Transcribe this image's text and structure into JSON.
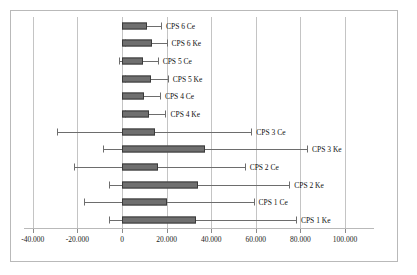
{
  "chart_data": {
    "type": "bar",
    "orientation": "horizontal",
    "title": "",
    "xlabel": "",
    "ylabel": "",
    "xlim": [
      -50,
      110
    ],
    "grid": true,
    "legend": false,
    "xticks": [
      -40,
      -20,
      0,
      20,
      40,
      60,
      80,
      100
    ],
    "xticklabels": [
      "-40.000",
      "-20.000",
      "0",
      "20.000",
      "40.000",
      "60.000",
      "80.000",
      "100.000"
    ],
    "categories": [
      "CPS 6 Ce",
      "CPS 6 Ke",
      "CPS 5 Ce",
      "CPS 5 Ke",
      "CPS 4 Ce",
      "CPS 4 Ke",
      "CPS 3 Ce",
      "CPS 3 Ke",
      "CPS 2 Ce",
      "CPS 2 Ke",
      "CPS 1 Ce",
      "CPS 1 Ke"
    ],
    "values": [
      11,
      13.5,
      9.5,
      13,
      10,
      12,
      15,
      37,
      16,
      34,
      20,
      33
    ],
    "error_low": [
      0,
      1.5,
      -1.5,
      1.5,
      0,
      1.5,
      -29,
      -8.5,
      -21.5,
      -6,
      -17,
      -6
    ],
    "error_high": [
      17.5,
      20,
      16,
      20.5,
      17,
      19.5,
      58,
      83,
      55,
      75,
      59,
      78
    ],
    "bar_color": "#6f6f6f",
    "bar_edge_color": "#3a3a3a",
    "error_color": "#6d6d6d",
    "grid_color": "#c4c4c4",
    "frame_color": "#b9b9b9"
  }
}
